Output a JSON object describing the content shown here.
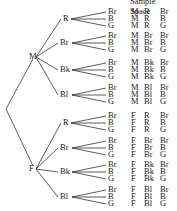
{
  "title": "Sample Space",
  "root": {
    "x": 6,
    "y": 109
  },
  "level1": [
    {
      "label": "M",
      "x": 37,
      "y": 57
    },
    {
      "label": "F",
      "x": 37,
      "y": 169
    }
  ],
  "level2_labels": [
    "R",
    "Br",
    "Bk",
    "Bl"
  ],
  "level3_labels": [
    "Br",
    "B",
    "G"
  ],
  "level2_y": [
    19,
    43,
    70,
    95,
    123,
    148,
    172,
    197
  ],
  "outcomes": [
    [
      "M",
      "R",
      "Br"
    ],
    [
      "M",
      "R",
      "B"
    ],
    [
      "M",
      "R",
      "G"
    ],
    [
      "M",
      "Br",
      "Br"
    ],
    [
      "M",
      "Br",
      "B"
    ],
    [
      "M",
      "Br",
      "G"
    ],
    [
      "M",
      "Bk",
      "Br"
    ],
    [
      "M",
      "Bk",
      "B"
    ],
    [
      "M",
      "Bk",
      "G"
    ],
    [
      "M",
      "Bl",
      "Br"
    ],
    [
      "M",
      "Bl",
      "B"
    ],
    [
      "M",
      "Bl",
      "G"
    ],
    [
      "F",
      "R",
      "Br"
    ],
    [
      "F",
      "R",
      "B"
    ],
    [
      "F",
      "R",
      "G"
    ],
    [
      "F",
      "Br",
      "Br"
    ],
    [
      "F",
      "Br",
      "B"
    ],
    [
      "F",
      "Br",
      "G"
    ],
    [
      "F",
      "Bk",
      "Br"
    ],
    [
      "F",
      "Bk",
      "B"
    ],
    [
      "F",
      "Bk",
      "G"
    ],
    [
      "F",
      "Bl",
      "Br"
    ],
    [
      "F",
      "Bl",
      "B"
    ],
    [
      "F",
      "Bl",
      "G"
    ]
  ],
  "colors": {
    "line": "#333333",
    "text": "#222222"
  }
}
